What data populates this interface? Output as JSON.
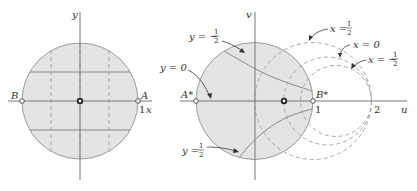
{
  "left_diagram": {
    "axis_x_label": "x",
    "axis_y_label": "y",
    "point_A_label": "A",
    "point_B_label": "B",
    "tick_1_label": "1",
    "horizontal_lines": [
      "y = 1/2",
      "y = -1/2",
      "y = 0"
    ],
    "vertical_dashed_lines": [
      "x = -1/2",
      "x = 0",
      "x = 1/2"
    ]
  },
  "right_diagram": {
    "axis_u_label": "u",
    "axis_v_label": "v",
    "point_A_label": "A*",
    "point_B_label": "B*",
    "tick_1_label": "1",
    "tick_2_label": "2",
    "curve_labels": {
      "y_neg_half": {
        "lhs": "y = −",
        "num": "1",
        "den": "2"
      },
      "y_zero": {
        "text": "y = 0"
      },
      "y_half": {
        "lhs": "y = ",
        "num": "1",
        "den": "2"
      },
      "x_half": {
        "lhs": "x = ",
        "num": "1",
        "den": "2"
      },
      "x_zero": {
        "text": "x = 0"
      },
      "x_neg_half": {
        "lhs": "x = −",
        "num": "1",
        "den": "2"
      }
    }
  },
  "colors": {
    "disk_fill": "#e4e4e4",
    "disk_stroke": "#9a9a9a",
    "axis": "#777777",
    "dashed": "#a8a8a8"
  }
}
